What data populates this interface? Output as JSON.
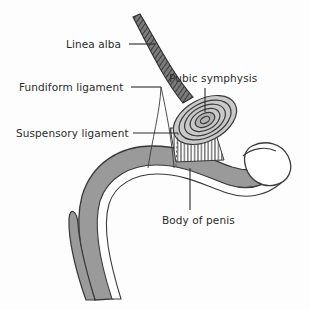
{
  "figure": {
    "type": "anatomical-line-drawing",
    "background_color": "#fdfdfd",
    "ink_color": "#2b2b2b",
    "tissue_fill": "#9a9a9a",
    "tissue_stroke": "#3a3a3a",
    "highlight_fill": "#ffffff"
  },
  "labels": [
    {
      "id": "linea-alba",
      "text": "Linea alba",
      "x": 66,
      "y": 38,
      "align": "left"
    },
    {
      "id": "fundiform-ligament",
      "text": "Fundiform ligament",
      "x": 19,
      "y": 81,
      "align": "left"
    },
    {
      "id": "suspensory-ligament",
      "text": "Suspensory ligament",
      "x": 16,
      "y": 127,
      "align": "left"
    },
    {
      "id": "pubic-symphysis",
      "text": "Pubic symphysis",
      "x": 169,
      "y": 72,
      "align": "left"
    },
    {
      "id": "body-of-penis",
      "text": "Body of penis",
      "x": 162,
      "y": 214,
      "align": "left"
    }
  ],
  "leader_lines": [
    {
      "id": "leader-linea-alba",
      "points": "129,44 155,44"
    },
    {
      "id": "leader-fundiform-ligament",
      "points": "131,87 161,87"
    },
    {
      "id": "leader-suspensory-ligament",
      "points": "133,133 178,133"
    },
    {
      "id": "leader-pubic-symphysis",
      "points": "205,88 205,112"
    },
    {
      "id": "leader-body-of-penis",
      "points": "190,210 190,168"
    }
  ],
  "structures": [
    {
      "id": "linea-alba-band",
      "name": "linea alba",
      "style": "hatched-band"
    },
    {
      "id": "pubic-symphysis-rings",
      "name": "pubic symphysis",
      "style": "concentric-ellipses",
      "ring_count": 6
    },
    {
      "id": "suspensory-fibers",
      "name": "suspensory ligament fibers",
      "style": "vertical-hatching",
      "fiber_count": 13
    },
    {
      "id": "penis-shaft",
      "name": "body of penis",
      "style": "filled-tube"
    },
    {
      "id": "glans",
      "name": "glans",
      "style": "outlined-white"
    },
    {
      "id": "crus-limbs",
      "name": "crus / root limbs",
      "style": "filled-tapered",
      "count": 2
    }
  ]
}
